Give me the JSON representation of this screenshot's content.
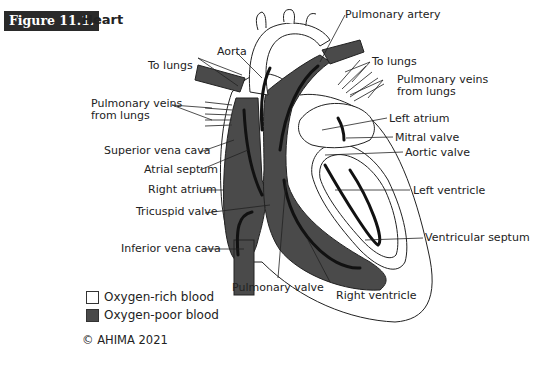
{
  "figure": {
    "number_label": "Figure 11.1.",
    "title": "Heart"
  },
  "labels": {
    "aorta": "Aorta",
    "to_lungs_left": "To lungs",
    "pulmonary_veins_left_1": "Pulmonary veins",
    "pulmonary_veins_left_2": "from lungs",
    "superior_vena_cava": "Superior vena cava",
    "atrial_septum": "Atrial septum",
    "right_atrium": "Right atrium",
    "tricuspid_valve": "Tricuspid valve",
    "inferior_vena_cava": "Inferior vena cava",
    "pulmonary_artery": "Pulmonary artery",
    "to_lungs_right": "To lungs",
    "pulmonary_veins_right_1": "Pulmonary veins",
    "pulmonary_veins_right_2": "from lungs",
    "left_atrium": "Left atrium",
    "mitral_valve": "Mitral valve",
    "aortic_valve": "Aortic valve",
    "left_ventricle": "Left ventricle",
    "ventricular_septum": "Ventricular septum",
    "pulmonary_valve": "Pulmonary valve",
    "right_ventricle": "Right ventricle"
  },
  "legend": [
    {
      "label": "Oxygen-rich blood",
      "color": "#ffffff"
    },
    {
      "label": "Oxygen-poor blood",
      "color": "#4a4a4a"
    }
  ],
  "copyright": "© AHIMA 2021",
  "colors": {
    "oxygen_poor": "#4a4a4a",
    "oxygen_rich": "#ffffff",
    "badge_bg": "#2a2a2a"
  }
}
